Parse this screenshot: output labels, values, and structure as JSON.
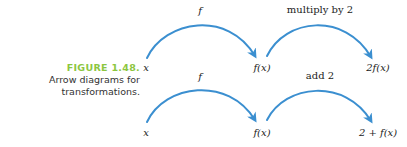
{
  "caption": {
    "figure_label": "FIGURE 1.48.",
    "line1": "Arrow diagrams for",
    "line2": "transformations."
  },
  "colors": {
    "arrow": "#3b8fd0",
    "figure_label": "#8cc63f",
    "text": "#222222"
  },
  "diagrams": [
    {
      "nodes": [
        "x",
        "f(x)",
        "2f(x)"
      ],
      "arrows": [
        {
          "label": "f",
          "label_style": "italic"
        },
        {
          "label": "multiply by 2",
          "label_style": "roman"
        }
      ]
    },
    {
      "nodes": [
        "x",
        "f(x)",
        "2 + f(x)"
      ],
      "arrows": [
        {
          "label": "f",
          "label_style": "italic"
        },
        {
          "label": "add 2",
          "label_style": "roman"
        }
      ]
    }
  ]
}
